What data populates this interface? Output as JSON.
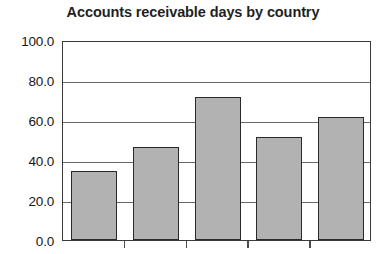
{
  "chart_data": {
    "type": "bar",
    "title": "Accounts receivable days by country",
    "xlabel": "",
    "ylabel": "",
    "categories": [
      "",
      "",
      "",
      "",
      ""
    ],
    "values": [
      34.3,
      46.5,
      71.5,
      51.5,
      61.5
    ],
    "ylim": [
      0.0,
      100.0
    ],
    "ytick_labels": [
      "0.0",
      "20.0",
      "40.0",
      "60.0",
      "80.0",
      "100.0"
    ],
    "ytick_values": [
      0,
      20,
      40,
      60,
      80,
      100
    ],
    "grid": true,
    "legend": "none",
    "bar_fill_color": "#b2b2b2",
    "bar_border_color": "#2a2a2a",
    "plot_background": "#ffffff",
    "gridline_color": "#6a6a6a",
    "axis_color": "#3a3a3a",
    "title_color": "#1f1f1f",
    "xtick_count": 4
  }
}
